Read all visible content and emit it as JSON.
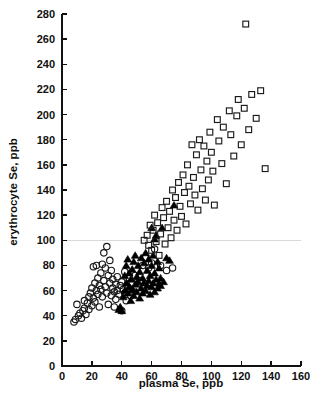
{
  "chart_data": {
    "type": "scatter",
    "title": "",
    "xlabel": "plasma Se, ppb",
    "ylabel": "erythrocyte Se, ppb",
    "xlim": [
      0,
      160
    ],
    "ylim": [
      0,
      280
    ],
    "xticks": [
      0,
      20,
      40,
      60,
      80,
      100,
      120,
      140,
      160
    ],
    "yticks": [
      0,
      20,
      40,
      60,
      80,
      100,
      120,
      140,
      160,
      180,
      200,
      220,
      240,
      260,
      280
    ],
    "grid": false,
    "legend": "none",
    "annotations": [
      {
        "type": "horizontal-reference-line",
        "y": 100,
        "color": "#cfcfcf"
      }
    ],
    "series": [
      {
        "name": "open-circle",
        "marker": "open-circle",
        "color": "#1a1a1a",
        "points": [
          [
            8,
            35
          ],
          [
            9,
            37
          ],
          [
            10,
            49
          ],
          [
            11,
            40
          ],
          [
            12,
            42
          ],
          [
            13,
            38
          ],
          [
            14,
            44
          ],
          [
            15,
            46
          ],
          [
            15,
            52
          ],
          [
            16,
            41
          ],
          [
            17,
            50
          ],
          [
            18,
            55
          ],
          [
            18,
            45
          ],
          [
            19,
            58
          ],
          [
            20,
            48
          ],
          [
            20,
            62
          ],
          [
            21,
            54
          ],
          [
            21,
            79
          ],
          [
            22,
            66
          ],
          [
            22,
            51
          ],
          [
            23,
            60
          ],
          [
            23,
            80
          ],
          [
            24,
            70
          ],
          [
            24,
            57
          ],
          [
            25,
            64
          ],
          [
            25,
            47
          ],
          [
            26,
            74
          ],
          [
            26,
            61
          ],
          [
            27,
            81
          ],
          [
            27,
            55
          ],
          [
            28,
            68
          ],
          [
            28,
            90
          ],
          [
            29,
            63
          ],
          [
            29,
            78
          ],
          [
            30,
            95
          ],
          [
            30,
            58
          ],
          [
            31,
            72
          ],
          [
            31,
            49
          ],
          [
            32,
            66
          ],
          [
            32,
            84
          ],
          [
            33,
            56
          ],
          [
            33,
            76
          ],
          [
            34,
            62
          ],
          [
            34,
            69
          ],
          [
            35,
            59
          ],
          [
            35,
            47
          ],
          [
            36,
            65
          ],
          [
            36,
            53
          ],
          [
            37,
            71
          ],
          [
            37,
            60
          ],
          [
            38,
            57
          ],
          [
            39,
            64
          ],
          [
            40,
            44
          ],
          [
            40,
            67
          ],
          [
            41,
            61
          ],
          [
            42,
            58
          ],
          [
            42,
            75
          ],
          [
            43,
            52
          ],
          [
            44,
            63
          ],
          [
            45,
            70
          ],
          [
            46,
            56
          ],
          [
            47,
            66
          ],
          [
            48,
            59
          ],
          [
            49,
            72
          ],
          [
            50,
            62
          ],
          [
            52,
            68
          ],
          [
            54,
            80
          ],
          [
            56,
            86
          ],
          [
            58,
            78
          ],
          [
            60,
            82
          ],
          [
            62,
            93
          ],
          [
            66,
            80
          ],
          [
            70,
            76
          ],
          [
            74,
            78
          ]
        ]
      },
      {
        "name": "filled-triangle",
        "marker": "filled-triangle",
        "color": "#000000",
        "points": [
          [
            38,
            45
          ],
          [
            39,
            47
          ],
          [
            40,
            44
          ],
          [
            41,
            55
          ],
          [
            42,
            60
          ],
          [
            42,
            72
          ],
          [
            43,
            66
          ],
          [
            43,
            80
          ],
          [
            44,
            58
          ],
          [
            44,
            85
          ],
          [
            45,
            63
          ],
          [
            45,
            74
          ],
          [
            46,
            52
          ],
          [
            46,
            69
          ],
          [
            47,
            77
          ],
          [
            47,
            61
          ],
          [
            48,
            56
          ],
          [
            48,
            83
          ],
          [
            49,
            65
          ],
          [
            49,
            88
          ],
          [
            50,
            59
          ],
          [
            50,
            71
          ],
          [
            51,
            67
          ],
          [
            51,
            80
          ],
          [
            52,
            54
          ],
          [
            52,
            75
          ],
          [
            53,
            62
          ],
          [
            53,
            86
          ],
          [
            54,
            58
          ],
          [
            54,
            70
          ],
          [
            55,
            66
          ],
          [
            55,
            82
          ],
          [
            56,
            60
          ],
          [
            56,
            90
          ],
          [
            57,
            64
          ],
          [
            57,
            76
          ],
          [
            58,
            68
          ],
          [
            58,
            85
          ],
          [
            59,
            57
          ],
          [
            59,
            72
          ],
          [
            60,
            63
          ],
          [
            60,
            80
          ],
          [
            60,
            110
          ],
          [
            61,
            66
          ],
          [
            61,
            88
          ],
          [
            62,
            59
          ],
          [
            62,
            74
          ],
          [
            62,
            101
          ],
          [
            63,
            69
          ],
          [
            63,
            104
          ],
          [
            64,
            62
          ],
          [
            64,
            83
          ],
          [
            65,
            66
          ],
          [
            65,
            78
          ],
          [
            66,
            70
          ],
          [
            66,
            64
          ],
          [
            67,
            110
          ],
          [
            68,
            67
          ],
          [
            70,
            86
          ],
          [
            72,
            84
          ],
          [
            75,
            128
          ]
        ]
      },
      {
        "name": "open-square",
        "marker": "open-square",
        "color": "#1a1a1a",
        "points": [
          [
            55,
            100
          ],
          [
            57,
            104
          ],
          [
            58,
            96
          ],
          [
            59,
            112
          ],
          [
            60,
            92
          ],
          [
            61,
            108
          ],
          [
            62,
            120
          ],
          [
            63,
            99
          ],
          [
            64,
            114
          ],
          [
            65,
            88
          ],
          [
            66,
            105
          ],
          [
            67,
            126
          ],
          [
            68,
            118
          ],
          [
            69,
            97
          ],
          [
            70,
            131
          ],
          [
            71,
            110
          ],
          [
            72,
            123
          ],
          [
            73,
            102
          ],
          [
            74,
            140
          ],
          [
            75,
            116
          ],
          [
            76,
            134
          ],
          [
            77,
            108
          ],
          [
            78,
            146
          ],
          [
            79,
            127
          ],
          [
            80,
            119
          ],
          [
            81,
            152
          ],
          [
            82,
            138
          ],
          [
            83,
            113
          ],
          [
            84,
            160
          ],
          [
            85,
            143
          ],
          [
            86,
            129
          ],
          [
            87,
            176
          ],
          [
            88,
            150
          ],
          [
            89,
            136
          ],
          [
            90,
            168
          ],
          [
            91,
            124
          ],
          [
            92,
            180
          ],
          [
            93,
            156
          ],
          [
            94,
            141
          ],
          [
            95,
            175
          ],
          [
            96,
            132
          ],
          [
            97,
            163
          ],
          [
            98,
            148
          ],
          [
            99,
            186
          ],
          [
            100,
            170
          ],
          [
            101,
            155
          ],
          [
            102,
            128
          ],
          [
            104,
            196
          ],
          [
            105,
            179
          ],
          [
            107,
            161
          ],
          [
            108,
            190
          ],
          [
            110,
            145
          ],
          [
            112,
            203
          ],
          [
            113,
            184
          ],
          [
            115,
            167
          ],
          [
            117,
            199
          ],
          [
            118,
            212
          ],
          [
            120,
            176
          ],
          [
            122,
            205
          ],
          [
            123,
            272
          ],
          [
            125,
            188
          ],
          [
            127,
            216
          ],
          [
            130,
            197
          ],
          [
            133,
            219
          ],
          [
            136,
            157
          ]
        ]
      }
    ]
  }
}
